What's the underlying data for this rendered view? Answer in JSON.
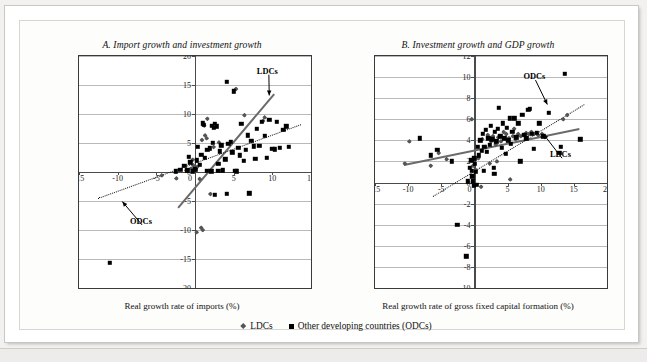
{
  "figure": {
    "legend": [
      {
        "marker": "diamond-marker",
        "label": "LDCs",
        "color": "#555555"
      },
      {
        "marker": "square-marker",
        "label": "Other developing countries (ODCs)",
        "color": "#000000"
      }
    ]
  },
  "chart_data": [
    {
      "id": "panel-a",
      "type": "scatter",
      "title": "A. Import growth and investment growth",
      "xlabel": "Real growth rate of imports (%)",
      "ylabel": "Real growth rate of gross fixed capital formation (%)",
      "xlim": [
        -15,
        15
      ],
      "ylim": [
        -20,
        20
      ],
      "xticks": [
        -15,
        -10,
        -5,
        0,
        5,
        10,
        15
      ],
      "yticks": [
        -20,
        -15,
        -10,
        -5,
        0,
        5,
        10,
        15,
        20
      ],
      "grid": true,
      "legend_position": "below-figure",
      "annotations": [
        {
          "text": "LDCs",
          "x": 8.0,
          "y": 17.3,
          "arrow_to_x": 9.6,
          "arrow_to_y": 13.2
        },
        {
          "text": "ODCs",
          "x": -8.4,
          "y": -8.6,
          "arrow_to_x": -9.4,
          "arrow_to_y": -5.1
        }
      ],
      "trendlines": [
        {
          "name": "LDCs",
          "style": "solid",
          "color": "#6a6a6a",
          "x0": -2.2,
          "y0": -6.0,
          "x1": 10.2,
          "y1": 13.6
        },
        {
          "name": "ODCs",
          "style": "dotted",
          "color": "#111111",
          "x0": -12.6,
          "y0": -4.4,
          "x1": 13.6,
          "y1": 8.3
        }
      ],
      "series": [
        {
          "name": "LDCs",
          "marker": "diamond",
          "color": "#555555",
          "points": [
            [
              -4.3,
              -0.6
            ],
            [
              -2.4,
              -1.1
            ],
            [
              -1.1,
              0.3
            ],
            [
              -0.5,
              0.6
            ],
            [
              -0.2,
              1.1
            ],
            [
              0.3,
              0.9
            ],
            [
              0.6,
              -1.2
            ],
            [
              0.9,
              5.5
            ],
            [
              1.0,
              -10.0
            ],
            [
              1.2,
              8.0
            ],
            [
              1.3,
              6.3
            ],
            [
              1.5,
              5.8
            ],
            [
              1.6,
              9.2
            ],
            [
              1.8,
              0.2
            ],
            [
              2.0,
              -3.8
            ],
            [
              2.4,
              4.3
            ],
            [
              3.1,
              5.1
            ],
            [
              5.3,
              14.3
            ],
            [
              6.4,
              9.8
            ],
            [
              8.8,
              8.8
            ],
            [
              9.0,
              9.4
            ],
            [
              0.8,
              -9.6
            ],
            [
              0.2,
              -10.4
            ],
            [
              -0.3,
              2.1
            ]
          ]
        },
        {
          "name": "Other developing countries (ODCs)",
          "marker": "square",
          "color": "#000000",
          "points": [
            [
              -11.0,
              -15.7
            ],
            [
              -2.5,
              0.1
            ],
            [
              -1.9,
              0.4
            ],
            [
              -1.4,
              1.1
            ],
            [
              -1.0,
              0.3
            ],
            [
              -0.6,
              1.7
            ],
            [
              -0.3,
              0.1
            ],
            [
              0.1,
              0.4
            ],
            [
              0.2,
              2.0
            ],
            [
              0.4,
              4.3
            ],
            [
              0.6,
              1.2
            ],
            [
              0.8,
              3.0
            ],
            [
              1.0,
              8.4
            ],
            [
              1.1,
              8.1
            ],
            [
              1.3,
              2.4
            ],
            [
              1.5,
              0.2
            ],
            [
              1.6,
              3.8
            ],
            [
              1.9,
              4.1
            ],
            [
              2.1,
              0.1
            ],
            [
              2.3,
              5.0
            ],
            [
              2.4,
              7.6
            ],
            [
              2.6,
              8.3
            ],
            [
              2.8,
              7.9
            ],
            [
              3.0,
              1.4
            ],
            [
              3.2,
              3.6
            ],
            [
              3.4,
              4.6
            ],
            [
              3.6,
              0.3
            ],
            [
              3.9,
              2.2
            ],
            [
              4.1,
              15.6
            ],
            [
              4.3,
              4.9
            ],
            [
              4.6,
              5.2
            ],
            [
              4.8,
              3.4
            ],
            [
              5.0,
              13.9
            ],
            [
              5.2,
              0.2
            ],
            [
              5.4,
              0.1
            ],
            [
              5.6,
              4.2
            ],
            [
              5.8,
              2.9
            ],
            [
              6.0,
              8.3
            ],
            [
              6.3,
              1.9
            ],
            [
              6.6,
              3.8
            ],
            [
              7.0,
              -3.7
            ],
            [
              7.3,
              5.4
            ],
            [
              7.6,
              4.4
            ],
            [
              8.0,
              7.4
            ],
            [
              8.3,
              4.5
            ],
            [
              8.6,
              8.7
            ],
            [
              9.0,
              6.2
            ],
            [
              9.3,
              2.5
            ],
            [
              9.6,
              9.0
            ],
            [
              10.0,
              4.0
            ],
            [
              10.3,
              3.9
            ],
            [
              10.6,
              8.7
            ],
            [
              11.0,
              4.2
            ],
            [
              11.4,
              7.3
            ],
            [
              11.8,
              7.9
            ],
            [
              12.1,
              4.3
            ],
            [
              4.1,
              -3.8
            ],
            [
              2.6,
              -3.9
            ],
            [
              3.0,
              0.2
            ],
            [
              0.0,
              0.6
            ],
            [
              -0.8,
              2.6
            ],
            [
              6.8,
              6.3
            ],
            [
              7.8,
              2.3
            ],
            [
              2.2,
              8.0
            ]
          ]
        }
      ]
    },
    {
      "id": "panel-b",
      "type": "scatter",
      "title": "B. Investment growth and GDP growth",
      "xlabel": "Real growth rate of gross fixed capital formation (%)",
      "ylabel": "Real growth rate of GDP (%)",
      "xlim": [
        -15,
        20
      ],
      "ylim": [
        -10,
        12
      ],
      "xticks": [
        -15,
        -10,
        -5,
        0,
        5,
        10,
        15,
        20
      ],
      "yticks": [
        -10,
        -8,
        -6,
        -4,
        -2,
        0,
        2,
        4,
        6,
        8,
        10,
        12
      ],
      "grid": true,
      "legend_position": "below-figure",
      "annotations": [
        {
          "text": "ODCs",
          "x": 7.4,
          "y": 10.0,
          "arrow_to_x": 11.0,
          "arrow_to_y": 7.4
        },
        {
          "text": "LDCs",
          "x": 11.4,
          "y": 2.6,
          "arrow_to_x": 10.4,
          "arrow_to_y": 4.6
        }
      ],
      "trendlines": [
        {
          "name": "LDCs",
          "style": "solid",
          "color": "#6a6a6a",
          "x0": -10.6,
          "y0": 1.8,
          "x1": 15.8,
          "y1": 5.2
        },
        {
          "name": "ODCs",
          "style": "dotted",
          "color": "#111111",
          "x0": -6.2,
          "y0": -1.3,
          "x1": 16.6,
          "y1": 7.4
        }
      ],
      "series": [
        {
          "name": "LDCs",
          "marker": "diamond",
          "color": "#555555",
          "points": [
            [
              -10.5,
              1.8
            ],
            [
              -9.8,
              3.9
            ],
            [
              -6.6,
              1.6
            ],
            [
              -5.4,
              2.8
            ],
            [
              -4.2,
              2.2
            ],
            [
              -0.4,
              6.0
            ],
            [
              -0.2,
              1.6
            ],
            [
              0.2,
              1.2
            ],
            [
              0.6,
              2.3
            ],
            [
              1.2,
              4.1
            ],
            [
              1.6,
              3.4
            ],
            [
              2.0,
              4.5
            ],
            [
              2.3,
              1.8
            ],
            [
              2.8,
              4.4
            ],
            [
              3.2,
              3.6
            ],
            [
              3.6,
              4.3
            ],
            [
              4.0,
              3.9
            ],
            [
              4.4,
              4.8
            ],
            [
              4.8,
              4.6
            ],
            [
              5.2,
              4.2
            ],
            [
              5.4,
              0.3
            ],
            [
              5.8,
              4.4
            ],
            [
              6.2,
              4.1
            ],
            [
              6.6,
              4.6
            ],
            [
              7.0,
              4.4
            ],
            [
              7.4,
              4.5
            ],
            [
              7.8,
              4.7
            ],
            [
              8.2,
              4.6
            ],
            [
              8.6,
              4.8
            ],
            [
              9.0,
              4.6
            ],
            [
              9.6,
              4.5
            ],
            [
              10.2,
              4.6
            ],
            [
              13.4,
              6.0
            ],
            [
              14.0,
              6.4
            ],
            [
              1.0,
              -0.4
            ],
            [
              3.4,
              2.0
            ],
            [
              6.0,
              5.1
            ],
            [
              2.5,
              3.9
            ]
          ]
        },
        {
          "name": "Other developing countries (ODCs)",
          "marker": "square",
          "color": "#000000",
          "points": [
            [
              -8.2,
              4.2
            ],
            [
              -6.6,
              2.6
            ],
            [
              -5.6,
              3.1
            ],
            [
              -3.4,
              2.0
            ],
            [
              -2.6,
              -4.0
            ],
            [
              -1.2,
              -7.0
            ],
            [
              -1.0,
              0.1
            ],
            [
              -0.7,
              1.4
            ],
            [
              -0.5,
              2.1
            ],
            [
              -0.4,
              1.1
            ],
            [
              -0.3,
              0.6
            ],
            [
              -0.2,
              0.1
            ],
            [
              0.0,
              2.3
            ],
            [
              0.2,
              1.0
            ],
            [
              0.3,
              -0.2
            ],
            [
              0.5,
              3.4
            ],
            [
              0.7,
              2.6
            ],
            [
              0.9,
              4.0
            ],
            [
              1.1,
              3.0
            ],
            [
              1.3,
              4.6
            ],
            [
              1.5,
              3.4
            ],
            [
              1.7,
              5.0
            ],
            [
              1.9,
              2.9
            ],
            [
              2.1,
              4.2
            ],
            [
              2.3,
              3.6
            ],
            [
              2.5,
              5.4
            ],
            [
              2.7,
              4.1
            ],
            [
              2.9,
              1.4
            ],
            [
              3.1,
              4.8
            ],
            [
              3.3,
              3.9
            ],
            [
              3.5,
              5.1
            ],
            [
              3.7,
              7.1
            ],
            [
              3.9,
              4.4
            ],
            [
              4.1,
              3.3
            ],
            [
              4.3,
              5.6
            ],
            [
              4.5,
              4.2
            ],
            [
              4.7,
              2.7
            ],
            [
              4.9,
              5.2
            ],
            [
              5.1,
              4.0
            ],
            [
              5.3,
              6.1
            ],
            [
              5.5,
              3.7
            ],
            [
              5.7,
              4.8
            ],
            [
              6.0,
              6.1
            ],
            [
              6.3,
              4.3
            ],
            [
              6.6,
              5.6
            ],
            [
              6.9,
              2.0
            ],
            [
              7.2,
              6.4
            ],
            [
              7.5,
              4.5
            ],
            [
              7.8,
              4.2
            ],
            [
              8.1,
              6.9
            ],
            [
              8.4,
              7.0
            ],
            [
              8.7,
              4.6
            ],
            [
              9.0,
              3.2
            ],
            [
              9.4,
              4.7
            ],
            [
              9.8,
              5.6
            ],
            [
              10.4,
              4.4
            ],
            [
              11.2,
              6.6
            ],
            [
              13.6,
              10.3
            ],
            [
              13.0,
              3.4
            ],
            [
              16.0,
              4.1
            ],
            [
              12.8,
              2.8
            ],
            [
              -0.1,
              -0.3
            ],
            [
              0.1,
              1.8
            ],
            [
              3.0,
              0.8
            ],
            [
              1.4,
              1.1
            ]
          ]
        }
      ]
    }
  ]
}
